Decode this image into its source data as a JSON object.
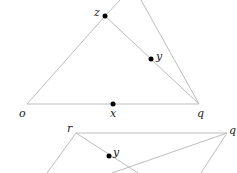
{
  "colors": {
    "line": "#bdbdbd",
    "point": "#000000",
    "label": "#222222"
  },
  "top_figure": {
    "labels": {
      "z": "z",
      "y": "y",
      "o": "o",
      "x": "x",
      "q": "q"
    }
  },
  "bottom_figure": {
    "labels": {
      "r": "r",
      "q": "q",
      "y": "y"
    }
  }
}
